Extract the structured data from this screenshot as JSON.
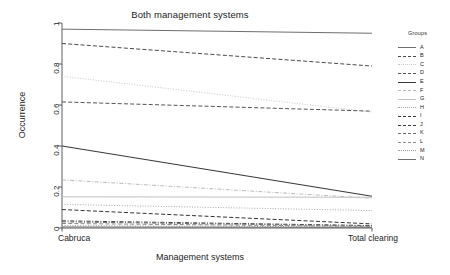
{
  "chart_data": {
    "type": "line",
    "title": "Both management systems",
    "xlabel": "Management systems",
    "ylabel": "Occurrence",
    "categories": [
      "Cabruca",
      "Total clearing"
    ],
    "x": [
      0,
      1
    ],
    "xtick_labels": [
      "Cabruca",
      "Total clearing"
    ],
    "ytick_labels": [
      "0",
      "0.2",
      "0.4",
      "0.6",
      "0.8",
      "1"
    ],
    "yticks": [
      0,
      0.2,
      0.4,
      0.6,
      0.8,
      1
    ],
    "ylim": [
      0,
      1
    ],
    "grid": false,
    "legend_position": "right",
    "legend_title": "Groups",
    "series": [
      {
        "name": "A",
        "values": [
          0.97,
          0.95
        ],
        "style": "solid",
        "color": "#6f6f6f",
        "width": 1.0
      },
      {
        "name": "B",
        "values": [
          0.9,
          0.79
        ],
        "style": "dashed",
        "color": "#4a4a4a",
        "width": 1.0
      },
      {
        "name": "C",
        "values": [
          0.74,
          0.565
        ],
        "style": "dotted",
        "color": "#c8c8c8",
        "width": 1.0
      },
      {
        "name": "D",
        "values": [
          0.615,
          0.57
        ],
        "style": "dashed",
        "color": "#555555",
        "width": 1.0
      },
      {
        "name": "E",
        "values": [
          0.4,
          0.155
        ],
        "style": "solid",
        "color": "#3a3a3a",
        "width": 1.2
      },
      {
        "name": "F",
        "values": [
          0.235,
          0.145
        ],
        "style": "dashdot",
        "color": "#bcbcbc",
        "width": 1.0
      },
      {
        "name": "G",
        "values": [
          0.152,
          0.15
        ],
        "style": "solid",
        "color": "#c0c0c0",
        "width": 1.0
      },
      {
        "name": "H",
        "values": [
          0.115,
          0.085
        ],
        "style": "dotted",
        "color": "#a8a8a8",
        "width": 1.0
      },
      {
        "name": "I",
        "values": [
          0.09,
          0.02
        ],
        "style": "dashed",
        "color": "#333333",
        "width": 1.0
      },
      {
        "name": "J",
        "values": [
          0.035,
          0.012
        ],
        "style": "dashdot",
        "color": "#3d3d3d",
        "width": 1.0
      },
      {
        "name": "K",
        "values": [
          0.03,
          0.01
        ],
        "style": "dashdot",
        "color": "#6a6a6a",
        "width": 1.0
      },
      {
        "name": "L",
        "values": [
          0.022,
          0.008
        ],
        "style": "dashed",
        "color": "#8a8a8a",
        "width": 1.0
      },
      {
        "name": "M",
        "values": [
          0.012,
          0.005
        ],
        "style": "dotted",
        "color": "#9a9a9a",
        "width": 1.0
      },
      {
        "name": "N",
        "values": [
          0.005,
          0.003
        ],
        "style": "solid",
        "color": "#707070",
        "width": 1.0
      }
    ]
  },
  "legend": {
    "title": "Groups",
    "items": [
      {
        "label": "A"
      },
      {
        "label": "B"
      },
      {
        "label": "C"
      },
      {
        "label": "D"
      },
      {
        "label": "E"
      },
      {
        "label": "F"
      },
      {
        "label": "G"
      },
      {
        "label": "H"
      },
      {
        "label": "I"
      },
      {
        "label": "J"
      },
      {
        "label": "K"
      },
      {
        "label": "L"
      },
      {
        "label": "M"
      },
      {
        "label": "N"
      }
    ]
  },
  "axes": {
    "title": "Both management systems",
    "x_title": "Management systems",
    "y_title": "Occurrence",
    "x_left_label": "Cabruca",
    "x_right_label": "Total clearing"
  },
  "colors": {
    "axis": "#4d4d4d",
    "text": "#1d1d1d",
    "background": "#ffffff"
  }
}
